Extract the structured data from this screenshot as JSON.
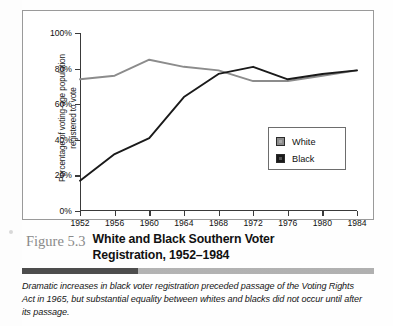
{
  "figure": {
    "number_label": "Figure 5.3",
    "title": "White and Black Southern Voter Registration, 1952–1984",
    "title_line1": "White and Black Southern Voter",
    "title_line2": "Registration, 1952–1984",
    "body_text": "Dramatic increases in black voter registration preceded passage of the Voting Rights Act in 1965, but substantial equality between whites and blacks did not occur until after its passage."
  },
  "axis_title": {
    "line1": "Percentage of voting-age population",
    "line2": "registered to vote"
  },
  "legend": {
    "items": [
      {
        "label": "White",
        "color": "#8c8c8c"
      },
      {
        "label": "Black",
        "color": "#1a1a1a"
      }
    ]
  },
  "colors": {
    "white_series": "#8c8c8c",
    "black_series": "#1a1a1a",
    "axis": "#3a3a3a",
    "frame": "#9a9a9a",
    "fig_num": "#8a8a8a",
    "rule_dark": "#4d4d4d",
    "rule_light": "#b3b3b3"
  },
  "chart_data": {
    "type": "line",
    "title": "White and Black Southern Voter Registration, 1952–1984",
    "xlabel": "",
    "ylabel": "Percentage of voting-age population registered to vote",
    "x": [
      1952,
      1956,
      1960,
      1964,
      1968,
      1972,
      1976,
      1980,
      1984
    ],
    "categories": [
      "1952",
      "1956",
      "1960",
      "1964",
      "1968",
      "1972",
      "1976",
      "1980",
      "1984"
    ],
    "xtick_labels": [
      "1952",
      "1956",
      "1960",
      "1964",
      "1968",
      "1972",
      "1976",
      "1980",
      "1984"
    ],
    "ytick_labels": [
      "0%",
      "20%",
      "40%",
      "60%",
      "80%",
      "100%"
    ],
    "ytick_values": [
      0,
      20,
      40,
      60,
      80,
      100
    ],
    "ylim": [
      0,
      100
    ],
    "xlim": [
      1952,
      1984
    ],
    "grid": false,
    "legend_position": "inside-right",
    "series": [
      {
        "name": "White",
        "color": "#8c8c8c",
        "values": [
          74,
          76,
          85,
          81,
          79,
          73,
          73,
          76,
          79
        ]
      },
      {
        "name": "Black",
        "color": "#1a1a1a",
        "values": [
          17,
          32,
          41,
          64,
          77,
          81,
          74,
          77,
          79
        ]
      }
    ]
  }
}
